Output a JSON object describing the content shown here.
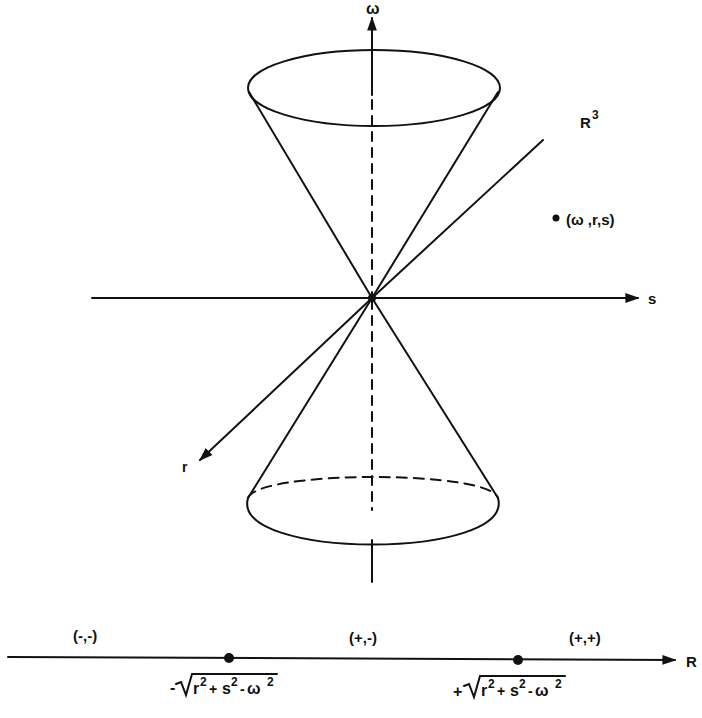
{
  "axes": {
    "omega": "ω",
    "s": "s",
    "r": "r"
  },
  "space_label": {
    "base": "R",
    "exp": "3"
  },
  "point_label": "(ω ,r,s)",
  "line": {
    "axis_label": "R",
    "regions": [
      "(-,-)",
      "(+,-)",
      "(+,+)"
    ],
    "left_point": {
      "sign": "-",
      "radicand_r": "r",
      "radicand_s": "s",
      "radicand_w": "ω",
      "exp": "2"
    },
    "right_point": {
      "sign": "+",
      "radicand_r": "r",
      "radicand_s": "s",
      "radicand_w": "ω",
      "exp": "2"
    }
  },
  "colors": {
    "ink": "#111111",
    "background": "#ffffff"
  }
}
